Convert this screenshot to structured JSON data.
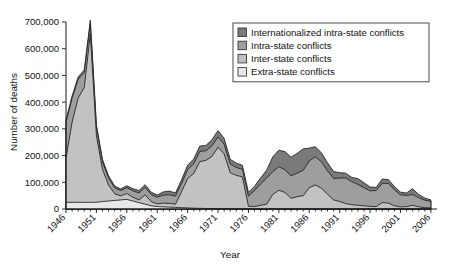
{
  "chart_data": {
    "type": "area",
    "stacked": true,
    "title": "",
    "xlabel": "Year",
    "ylabel": "Number of deaths",
    "xlim": [
      1946,
      2007
    ],
    "ylim": [
      0,
      700000
    ],
    "ytick_values": [
      0,
      100000,
      200000,
      300000,
      400000,
      500000,
      600000,
      700000
    ],
    "ytick_labels": [
      "0",
      "100,000",
      "200,000",
      "300,000",
      "400,000",
      "500,000",
      "600,000",
      "700,000"
    ],
    "xtick_values": [
      1946,
      1951,
      1956,
      1961,
      1966,
      1971,
      1976,
      1981,
      1986,
      1991,
      1996,
      2001,
      2006
    ],
    "xtick_labels": [
      "1946",
      "1951",
      "1956",
      "1961",
      "1966",
      "1971",
      "1976",
      "1981",
      "1986",
      "1991",
      "1996",
      "2001",
      "2006"
    ],
    "minor_xticks_every": 1,
    "grid": false,
    "legend_position": "top-right",
    "x": [
      1946,
      1947,
      1948,
      1949,
      1950,
      1951,
      1952,
      1953,
      1954,
      1955,
      1956,
      1957,
      1958,
      1959,
      1960,
      1961,
      1962,
      1963,
      1964,
      1965,
      1966,
      1967,
      1968,
      1969,
      1970,
      1971,
      1972,
      1973,
      1974,
      1975,
      1976,
      1977,
      1978,
      1979,
      1980,
      1981,
      1982,
      1983,
      1984,
      1985,
      1986,
      1987,
      1988,
      1989,
      1990,
      1991,
      1992,
      1993,
      1994,
      1995,
      1996,
      1997,
      1998,
      1999,
      2000,
      2001,
      2002,
      2003,
      2004,
      2005,
      2006
    ],
    "series": [
      {
        "name": "Extra-state conflicts",
        "color": "#e8e8e8",
        "values": [
          25000,
          25000,
          25000,
          25000,
          25000,
          25000,
          28000,
          30000,
          32000,
          34000,
          36000,
          30000,
          24000,
          18000,
          12000,
          9000,
          8000,
          7000,
          6000,
          5000,
          4000,
          3000,
          2500,
          2000,
          1800,
          1500,
          1200,
          900,
          700,
          500,
          200,
          0,
          0,
          0,
          0,
          0,
          0,
          0,
          0,
          0,
          0,
          0,
          0,
          0,
          0,
          0,
          0,
          0,
          0,
          0,
          0,
          0,
          0,
          0,
          0,
          0,
          0,
          0,
          0,
          0,
          0
        ]
      },
      {
        "name": "Inter-state conflicts",
        "color": "#c2c2c2",
        "values": [
          165000,
          300000,
          390000,
          430000,
          630000,
          250000,
          120000,
          60000,
          25000,
          15000,
          22000,
          14000,
          10000,
          35000,
          16000,
          10000,
          14000,
          14000,
          12000,
          60000,
          110000,
          130000,
          175000,
          180000,
          195000,
          230000,
          205000,
          135000,
          125000,
          120000,
          10000,
          9000,
          14000,
          18000,
          55000,
          70000,
          62000,
          40000,
          46000,
          50000,
          80000,
          90000,
          78000,
          55000,
          34000,
          28000,
          20000,
          16000,
          14000,
          12000,
          10000,
          9000,
          24000,
          22000,
          12000,
          8000,
          9000,
          14000,
          8000,
          5000,
          4000
        ]
      },
      {
        "name": "Intra-state conflicts",
        "color": "#9e9e9e",
        "values": [
          135000,
          90000,
          70000,
          55000,
          40000,
          30000,
          28000,
          26000,
          22000,
          20000,
          22000,
          24000,
          26000,
          28000,
          26000,
          25000,
          30000,
          32000,
          30000,
          30000,
          34000,
          36000,
          38000,
          36000,
          40000,
          38000,
          36000,
          32000,
          30000,
          28000,
          38000,
          60000,
          80000,
          98000,
          85000,
          88000,
          85000,
          84000,
          88000,
          95000,
          100000,
          105000,
          98000,
          88000,
          80000,
          88000,
          96000,
          86000,
          78000,
          68000,
          58000,
          60000,
          72000,
          74000,
          60000,
          45000,
          42000,
          40000,
          34000,
          28000,
          24000
        ]
      },
      {
        "name": "Internationalized intra-state conflicts",
        "color": "#7a7a7a",
        "values": [
          8000,
          8000,
          9000,
          10000,
          12000,
          10000,
          9000,
          8000,
          7000,
          6000,
          7000,
          8000,
          9000,
          10000,
          9000,
          8000,
          12000,
          14000,
          12000,
          14000,
          16000,
          18000,
          20000,
          20000,
          22000,
          24000,
          22000,
          18000,
          16000,
          15000,
          14000,
          16000,
          22000,
          30000,
          55000,
          62000,
          68000,
          70000,
          74000,
          80000,
          48000,
          38000,
          34000,
          30000,
          26000,
          20000,
          18000,
          16000,
          22000,
          18000,
          14000,
          12000,
          16000,
          14000,
          12000,
          10000,
          9000,
          22000,
          12000,
          8000,
          6000
        ]
      }
    ]
  },
  "legend": {
    "items": [
      {
        "label": "Internationalized intra-state conflicts",
        "color": "#7a7a7a"
      },
      {
        "label": "Intra-state conflicts",
        "color": "#9e9e9e"
      },
      {
        "label": "Inter-state conflicts",
        "color": "#c2c2c2"
      },
      {
        "label": "Extra-state conflicts",
        "color": "#e8e8e8"
      }
    ]
  },
  "axes": {
    "y_title": "Number of deaths",
    "x_title": "Year"
  }
}
